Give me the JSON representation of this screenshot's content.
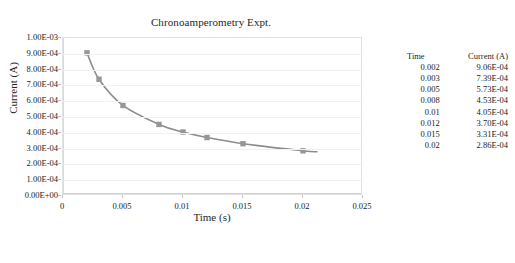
{
  "chart_data": {
    "type": "line",
    "title": "Chronoamperometry Expt.",
    "xlabel": "Time (s)",
    "ylabel": "Current (A)",
    "x": [
      0.002,
      0.003,
      0.005,
      0.008,
      0.01,
      0.012,
      0.015,
      0.02
    ],
    "values": [
      0.000906,
      0.000739,
      0.000573,
      0.000453,
      0.000405,
      0.00037,
      0.000331,
      0.000286
    ],
    "series": [
      {
        "name": "Current (A)",
        "x": [
          0.002,
          0.003,
          0.005,
          0.008,
          0.01,
          0.012,
          0.015,
          0.02
        ],
        "values": [
          0.000906,
          0.000739,
          0.000573,
          0.000453,
          0.000405,
          0.00037,
          0.000331,
          0.000286
        ]
      }
    ],
    "xlim": [
      0,
      0.025
    ],
    "ylim": [
      0,
      0.001
    ],
    "xticks": [
      "0",
      "0.005",
      "0.01",
      "0.015",
      "0.02",
      "0.025"
    ],
    "xtick_values": [
      0,
      0.005,
      0.01,
      0.015,
      0.02,
      0.025
    ],
    "yticks": [
      "0.00E+00",
      "1.00E-04",
      "2.00E-04",
      "3.00E-04",
      "4.00E-04",
      "5.00E-04",
      "6.00E-04",
      "7.00E-04",
      "8.00E-04",
      "9.00E-04",
      "1.00E-03"
    ],
    "ytick_values": [
      0,
      0.0001,
      0.0002,
      0.0003,
      0.0004,
      0.0005,
      0.0006,
      0.0007,
      0.0008,
      0.0009,
      0.001
    ],
    "grid": true,
    "grid_axis": "y",
    "legend": "none",
    "marker": "square",
    "line_color": "#8c8c8c",
    "marker_color": "#969696",
    "plot_border_color": "#e2e2e2"
  },
  "table": {
    "headers": [
      "Time",
      "Current (A)"
    ],
    "rows": [
      [
        "0.002",
        "9.06E-04"
      ],
      [
        "0.003",
        "7.39E-04"
      ],
      [
        "0.005",
        "5.73E-04"
      ],
      [
        "0.008",
        "4.53E-04"
      ],
      [
        "0.01",
        "4.05E-04"
      ],
      [
        "0.012",
        "3.70E-04"
      ],
      [
        "0.015",
        "3.31E-04"
      ],
      [
        "0.02",
        "2.86E-04"
      ]
    ]
  }
}
